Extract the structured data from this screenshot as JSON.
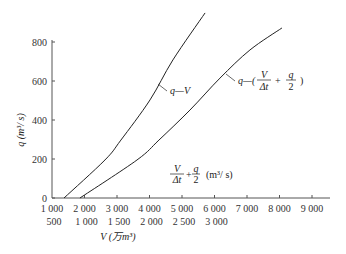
{
  "chart_data": {
    "type": "line",
    "title": "",
    "ylabel": "q (m³/ s)",
    "xlabel": "V (万m³)",
    "x_secondary_label": "V/Δt + q/2 (m³/ s)",
    "ylim": [
      0,
      800
    ],
    "y_ticks": [
      0,
      200,
      400,
      600,
      800
    ],
    "x_ticks_top_row": [
      "1 000",
      "2 000",
      "3 000",
      "4 000",
      "5 000",
      "6 000",
      "7 000",
      "8 000",
      "9 000"
    ],
    "x_ticks_bottom_row": [
      "500",
      "1 000",
      "1 500",
      "2 000",
      "2 500",
      "3 000"
    ],
    "grid": false,
    "series": [
      {
        "name": "q—V",
        "x_axis": "V (万m³)",
        "x": [
          685,
          1315,
          1560,
          2008,
          2360,
          2855
        ],
        "y": [
          0,
          195,
          297,
          503,
          708,
          949
        ]
      },
      {
        "name": "q—(V/Δt + q/2)",
        "x_axis": "V/Δt + q/2 (m³/ s)",
        "x": [
          1860,
          3615,
          4290,
          5245,
          6170,
          7090,
          8075
        ],
        "y": [
          0,
          195,
          297,
          451,
          615,
          759,
          872
        ]
      }
    ]
  },
  "labels": {
    "y_axis": "q (m",
    "y_axis_unit": "³/ s)",
    "x_axis_v": "V (万m³)",
    "curve1": "q—V",
    "curve2_prefix": "q—(",
    "curve2_suffix": ")",
    "frac_v_num": "V",
    "frac_v_den": "Δt",
    "frac_q_num": "q",
    "frac_q_den": "2",
    "plus": "+",
    "secondary_unit": "(m³/ s)"
  }
}
